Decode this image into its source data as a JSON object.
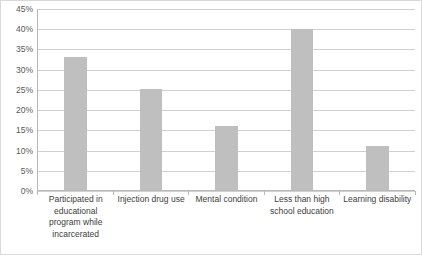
{
  "chart_data": {
    "type": "bar",
    "title": "",
    "subtitle": "",
    "xlabel": "",
    "ylabel": "",
    "categories": [
      "Participated in educational program while incarcerated",
      "Injection drug use",
      "Mental condition",
      "Less than high school education",
      "Learning disability"
    ],
    "values": [
      33,
      25,
      16,
      40,
      11
    ],
    "value_labels": [
      "33%",
      "25%",
      "16%",
      "40%",
      "11%"
    ],
    "ylim": [
      0,
      45
    ],
    "ytick_step": 5,
    "ytick_labels": [
      "0%",
      "5%",
      "10%",
      "15%",
      "20%",
      "25%",
      "30%",
      "35%",
      "40%",
      "45%"
    ],
    "ytick_values": [
      0,
      5,
      10,
      15,
      20,
      25,
      30,
      35,
      40,
      45
    ],
    "grid": true,
    "grid_axis": "y",
    "legend": false,
    "legend_position": "none",
    "series": [
      {
        "name": "",
        "values": [
          33,
          25,
          16,
          40,
          11
        ]
      }
    ],
    "colors": {
      "bar": "#bfbfbf",
      "gridline": "#d0d0d0",
      "axis": "#b8b8b8",
      "tick_text": "#595959",
      "category_text": "#404040",
      "frame_border": "#d9d9d9",
      "background": "#ffffff"
    }
  }
}
